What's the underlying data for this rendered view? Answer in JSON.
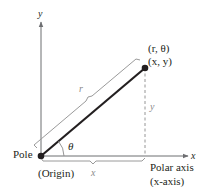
{
  "diagram": {
    "type": "polar-rectangular-coordinate-relationship",
    "axes": {
      "y_axis_label": "y",
      "x_axis_label": "x"
    },
    "point": {
      "polar_label": "(r, θ)",
      "rect_label": "(x, y)"
    },
    "segments": {
      "radius_label": "r",
      "horizontal_label": "x",
      "vertical_label": "y",
      "angle_label": "θ"
    },
    "origin": {
      "pole_label": "Pole",
      "origin_label": "(Origin)"
    },
    "polar_axis": {
      "label_line1": "Polar axis",
      "label_line2": "(x-axis)"
    },
    "colors": {
      "axis": "#6d6e71",
      "radius": "#231f20",
      "bracket": "#9a9a9a",
      "text": "#231f20"
    }
  }
}
